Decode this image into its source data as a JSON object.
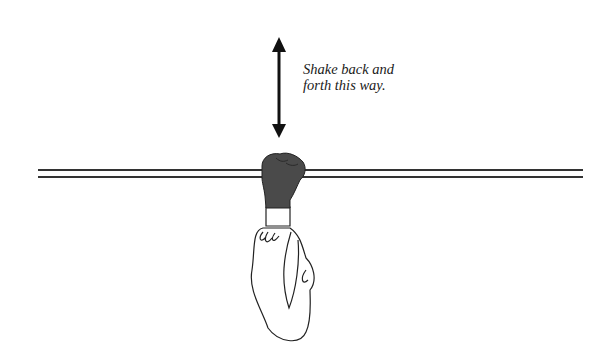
{
  "diagram": {
    "caption_lines": [
      "Shake back and",
      "forth this way."
    ],
    "elements": [
      {
        "name": "vertical-double-arrow",
        "meaning": "shake direction (up and down)"
      },
      {
        "name": "horizontal-bar",
        "meaning": "bar / rod held by hand"
      },
      {
        "name": "gloved-hand",
        "meaning": "dark gloved fist gripping bar"
      },
      {
        "name": "arm",
        "meaning": "arm in white sleeve hanging below"
      }
    ],
    "colors": {
      "glove": "#4a4a4a",
      "line": "#222222",
      "background": "#ffffff"
    }
  }
}
